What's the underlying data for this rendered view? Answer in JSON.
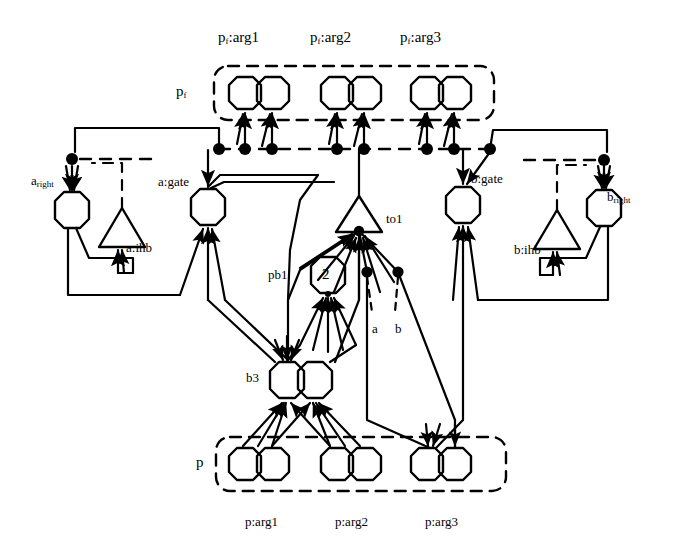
{
  "diagram": {
    "title_group_top": "p_f",
    "title_group_bottom": "p",
    "colors": {
      "stroke": "#000000",
      "background": "#ffffff"
    },
    "top_arg_labels": [
      {
        "id": "pf-arg1",
        "text": "p",
        "sub": "f",
        "suffix": ":arg1",
        "x": 218,
        "y": 30
      },
      {
        "id": "pf-arg2",
        "text": "p",
        "sub": "f",
        "suffix": ":arg2",
        "x": 310,
        "y": 30
      },
      {
        "id": "pf-arg3",
        "text": "p",
        "sub": "f",
        "suffix": ":arg3",
        "x": 400,
        "y": 30
      }
    ],
    "bottom_arg_labels": [
      {
        "id": "p-arg1",
        "text": "p:arg1",
        "x": 245,
        "y": 515
      },
      {
        "id": "p-arg2",
        "text": "p:arg2",
        "x": 335,
        "y": 515
      },
      {
        "id": "p-arg3",
        "text": "p:arg3",
        "x": 425,
        "y": 515
      }
    ],
    "group_labels": [
      {
        "id": "pf-group-label",
        "text": "p",
        "sub": "f",
        "x": 176,
        "y": 84
      },
      {
        "id": "p-group-label",
        "text": "p",
        "sub": "",
        "x": 196,
        "y": 455
      }
    ],
    "node_labels": [
      {
        "id": "a-right",
        "text": "a",
        "sub": "right",
        "x": 31,
        "y": 174
      },
      {
        "id": "a-gate",
        "text": "a:gate",
        "sub": "",
        "x": 158,
        "y": 175
      },
      {
        "id": "a-ihb",
        "text": "a:ihb",
        "sub": "",
        "x": 126,
        "y": 241
      },
      {
        "id": "b-gate",
        "text": "b:gate",
        "sub": "",
        "x": 471,
        "y": 172
      },
      {
        "id": "b-ihb",
        "text": "b:ihb",
        "sub": "",
        "x": 514,
        "y": 243
      },
      {
        "id": "b-right",
        "text": "b",
        "sub": "right",
        "x": 607,
        "y": 190
      },
      {
        "id": "to1",
        "text": "to1",
        "sub": "",
        "x": 386,
        "y": 212
      },
      {
        "id": "pb1",
        "text": "pb1",
        "sub": "",
        "x": 268,
        "y": 268
      },
      {
        "id": "b3",
        "text": "b3",
        "sub": "",
        "x": 246,
        "y": 371
      },
      {
        "id": "node-a",
        "text": "a",
        "sub": "",
        "x": 372,
        "y": 322
      },
      {
        "id": "node-b",
        "text": "b",
        "sub": "",
        "x": 395,
        "y": 322
      }
    ],
    "octagon_value_labels": [
      {
        "id": "pb1-value",
        "text": "2",
        "x": 322,
        "y": 268
      }
    ],
    "groups": {
      "pf_box": {
        "x": 214,
        "y": 66,
        "w": 280,
        "h": 54
      },
      "p_box": {
        "x": 216,
        "y": 437,
        "w": 290,
        "h": 54
      }
    },
    "octagon_pairs_top": [
      {
        "id": "pf-arg1-pair",
        "cx1": 245,
        "cx2": 273,
        "cy": 93
      },
      {
        "id": "pf-arg2-pair",
        "cx1": 337,
        "cx2": 365,
        "cy": 93
      },
      {
        "id": "pf-arg3-pair",
        "cx1": 427,
        "cx2": 455,
        "cy": 93
      }
    ],
    "octagon_pairs_bottom": [
      {
        "id": "p-arg1-pair",
        "cx1": 245,
        "cx2": 273,
        "cy": 464
      },
      {
        "id": "p-arg2-pair",
        "cx1": 337,
        "cx2": 365,
        "cy": 464
      },
      {
        "id": "p-arg3-pair",
        "cx1": 427,
        "cx2": 455,
        "cy": 464
      }
    ],
    "bus_dots": [
      {
        "id": "bus-dot-left-end",
        "x": 72,
        "y": 159
      },
      {
        "id": "bus-dot-1",
        "x": 219,
        "y": 149
      },
      {
        "id": "bus-dot-2",
        "x": 245,
        "y": 149
      },
      {
        "id": "bus-dot-3",
        "x": 272,
        "y": 149
      },
      {
        "id": "bus-dot-4",
        "x": 337,
        "y": 149
      },
      {
        "id": "bus-dot-5",
        "x": 364,
        "y": 149
      },
      {
        "id": "bus-dot-6",
        "x": 427,
        "y": 149
      },
      {
        "id": "bus-dot-7",
        "x": 454,
        "y": 149
      },
      {
        "id": "bus-dot-8",
        "x": 490,
        "y": 149
      },
      {
        "id": "bus-dot-right-end",
        "x": 604,
        "y": 160
      }
    ],
    "mid_dots": [
      {
        "id": "mid-dot-a",
        "x": 367,
        "y": 272
      },
      {
        "id": "mid-dot-b",
        "x": 398,
        "y": 272
      }
    ],
    "node_shapes": {
      "a_right_octagon": {
        "cx": 72,
        "cy": 210
      },
      "a_gate_octagon": {
        "cx": 208,
        "cy": 207
      },
      "b_gate_octagon": {
        "cx": 463,
        "cy": 205
      },
      "b_right_octagon": {
        "cx": 604,
        "cy": 208
      },
      "pb1_octagon": {
        "cx": 328,
        "cy": 276
      },
      "b3_octagon_left": {
        "cx": 287,
        "cy": 379
      },
      "b3_octagon_right": {
        "cx": 315,
        "cy": 379
      },
      "a_ihb_triangle": {
        "cx": 122,
        "cy": 233
      },
      "b_ihb_triangle": {
        "cx": 557,
        "cy": 235
      },
      "to1_triangle": {
        "cx": 359,
        "cy": 214
      }
    }
  }
}
